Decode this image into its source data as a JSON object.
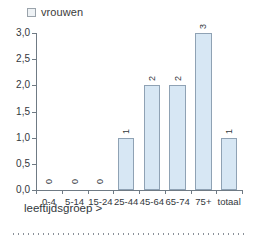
{
  "chart_data": {
    "type": "bar",
    "title": "",
    "subtitle": "",
    "xlabel": "leeftijdsgroep >",
    "ylabel": "",
    "categories": [
      "0-4",
      "5-14",
      "15-24",
      "25-44",
      "45-64",
      "65-74",
      "75+",
      "totaal"
    ],
    "values": [
      0,
      0,
      0,
      1,
      2,
      2,
      3,
      1
    ],
    "value_labels": [
      "0",
      "0",
      "0",
      "1",
      "2",
      "2",
      "3",
      "1"
    ],
    "series": [
      {
        "name": "vrouwen",
        "values": [
          0,
          0,
          0,
          1,
          2,
          2,
          3,
          1
        ],
        "color": "#d7e7f4"
      }
    ],
    "ylim": [
      0,
      3.0
    ],
    "ytick_labels": [
      "0,0",
      "0,5",
      "1,0",
      "1,5",
      "2,0",
      "2,5",
      "3,0"
    ],
    "ytick_values": [
      0,
      0.5,
      1.0,
      1.5,
      2.0,
      2.5,
      3.0
    ],
    "grid": false,
    "legend_position": "top-left",
    "value_label_rotation": "vertical",
    "bar_color": "#d7e7f4",
    "bar_border_color": "#8fa2b4",
    "axis_color": "#6f7a84"
  },
  "legend": {
    "swatch_name": "legend-swatch-vrouwen",
    "label": "vrouwen"
  },
  "axes": {
    "x_title": "leeftijdsgroep >"
  }
}
